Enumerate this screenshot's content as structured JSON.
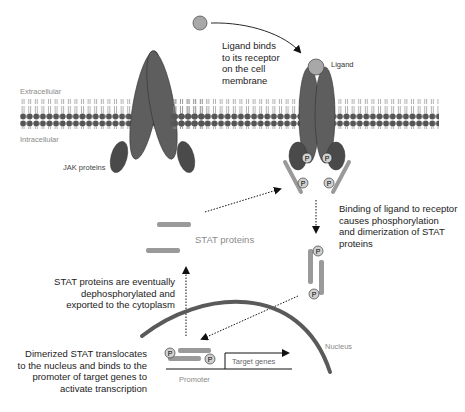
{
  "diagram": {
    "colors": {
      "protein": "#5e5e5e",
      "jak": "#4a4a4a",
      "stat": "#9a9a9a",
      "ligand": "#a8a8a8",
      "nucleus": "#5a5a5a",
      "lipid_head": "#555555",
      "text": "#222222",
      "gray_text": "#8a8a8a"
    },
    "labels": {
      "extracellular": "Extracellular",
      "intracellular": "Intracellular",
      "jak_proteins": "JAK proteins",
      "ligand": "Ligand",
      "ligand_binds": "Ligand binds\nto its receptor\non the cell\nmembrane",
      "binding_causes": "Binding of ligand to receptor\ncauses phosphorylation\nand dimerization of STAT\nproteins",
      "stat_proteins": "STAT proteins",
      "dephosphorylated": "STAT proteins are eventually\ndephosphorylated and\nexported to the cytoplasm",
      "nucleus": "Nucleus",
      "translocates": "Dimerized STAT translocates\nto the nucleus and binds to the\npromoter of target genes to\nactivate transcription",
      "promoter": "Promoter",
      "target_genes": "Target genes",
      "phosphate": "P"
    },
    "steps": [
      "Ligand binds to its receptor on the cell membrane",
      "Binding of ligand to receptor causes phosphorylation and dimerization of STAT proteins",
      "Dimerized STAT translocates to the nucleus and binds to the promoter of target genes to activate transcription",
      "STAT proteins are eventually dephosphorylated and exported to the cytoplasm"
    ]
  }
}
